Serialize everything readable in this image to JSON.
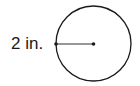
{
  "diagram": {
    "type": "circle-radius",
    "radius_label": "2 in.",
    "circle": {
      "cx": 93.5,
      "cy": 43.5,
      "r": 37.5,
      "stroke": "#1a1a1a"
    },
    "radius_segment": {
      "from": "left-edge",
      "to": "center"
    }
  }
}
